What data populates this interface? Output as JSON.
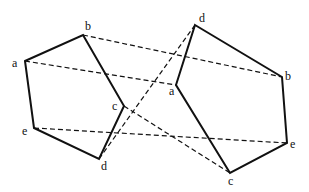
{
  "diagram": {
    "left_pentagon": {
      "vertices": [
        {
          "label": "a",
          "x": 25,
          "y": 61,
          "lx": 12,
          "ly": 67
        },
        {
          "label": "b",
          "x": 83,
          "y": 35,
          "lx": 85,
          "ly": 30
        },
        {
          "label": "c",
          "x": 124,
          "y": 106,
          "lx": 112,
          "ly": 110
        },
        {
          "label": "d",
          "x": 99,
          "y": 159,
          "lx": 101,
          "ly": 170
        },
        {
          "label": "e",
          "x": 34,
          "y": 128,
          "lx": 22,
          "ly": 135
        }
      ],
      "order": [
        "a",
        "b",
        "c",
        "d",
        "e"
      ]
    },
    "right_pentagon": {
      "vertices": [
        {
          "label": "d",
          "x": 195,
          "y": 25,
          "lx": 199,
          "ly": 22
        },
        {
          "label": "b",
          "x": 282,
          "y": 77,
          "lx": 285,
          "ly": 80
        },
        {
          "label": "e",
          "x": 287,
          "y": 143,
          "lx": 290,
          "ly": 148
        },
        {
          "label": "c",
          "x": 230,
          "y": 173,
          "lx": 228,
          "ly": 185
        },
        {
          "label": "a",
          "x": 176,
          "y": 85,
          "lx": 169,
          "ly": 95
        }
      ],
      "order": [
        "d",
        "b",
        "e",
        "c",
        "a"
      ]
    },
    "dashed_connections": [
      {
        "from": "a",
        "to": "a"
      },
      {
        "from": "b",
        "to": "b"
      },
      {
        "from": "c",
        "to": "c"
      },
      {
        "from": "d",
        "to": "d"
      },
      {
        "from": "e",
        "to": "e"
      }
    ],
    "colors": {
      "stroke": "#111111",
      "background": "#ffffff"
    }
  }
}
